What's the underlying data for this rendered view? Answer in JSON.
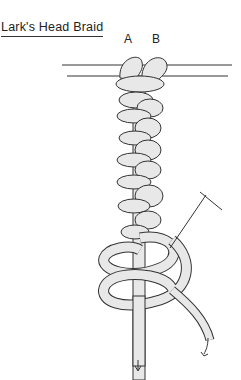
{
  "diagram": {
    "title": "Lark's Head Braid",
    "labels": {
      "a": "A",
      "b": "B"
    },
    "colors": {
      "line": "#333333",
      "cord_fill": "#e8e8e8",
      "background": "#ffffff"
    },
    "elements": [
      "holding-cord (two horizontal lines)",
      "cord A and cord B folded over holding cord",
      "alternating lark's head loops braided downward",
      "needle/pin tool inserted diagonally",
      "two loose cord ends with downward arrows"
    ]
  }
}
